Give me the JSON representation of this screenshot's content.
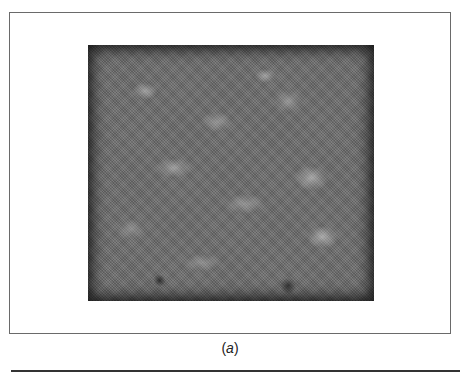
{
  "figure": {
    "panel_label": "(a)",
    "panel_letter": "a",
    "image_description": "grayscale mottled micrograph-like texture"
  },
  "colors": {
    "frame_border": "#6a6a6a",
    "image_base": "#6b6b6b",
    "rule": "#333333"
  }
}
